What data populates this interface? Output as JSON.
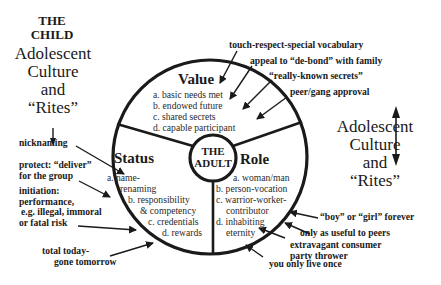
{
  "left_heading": {
    "line1": "THE",
    "line2": "CHILD",
    "culture_lines": [
      "Adolescent",
      "Culture",
      "and",
      "“Rites”"
    ]
  },
  "right_heading": {
    "culture_lines": [
      "Adolescent",
      "Culture",
      "and",
      "“Rites”"
    ]
  },
  "center": {
    "line1": "THE",
    "line2": "ADULT"
  },
  "segments": {
    "value": {
      "title": "Value",
      "items": [
        "a. basic needs met",
        "b. endowed future",
        "c.  shared secrets",
        "d. capable participant"
      ]
    },
    "status": {
      "title": "Status",
      "items": [
        "a. name-",
        "renaming",
        "b. responsibility",
        "& competency",
        "c. credentials",
        "d. rewards"
      ]
    },
    "role": {
      "title": "Role",
      "items": [
        "a. woman/man",
        "b. person-vocation",
        "c.  warrior-worker-",
        "contributor",
        "d. inhabiting",
        "eternity"
      ]
    }
  },
  "annotations": {
    "top": [
      "touch-respect-special vocabulary",
      "appeal to “de-bond” with family",
      "“really-known secrets”",
      "peer/gang approval"
    ],
    "left": [
      "nicknaming",
      "protect: “deliver”",
      "for the group",
      "initiation:",
      "performance,",
      "e.g. illegal, immoral",
      "or fatal risk",
      "total today-",
      "gone tomorrow"
    ],
    "right": [
      "“boy” or “girl” forever",
      "only as useful to peers",
      "extravagant consumer",
      "party thrower",
      "you only live once"
    ]
  },
  "colors": {
    "ink": "#1a1a1a",
    "background": "#ffffff"
  }
}
